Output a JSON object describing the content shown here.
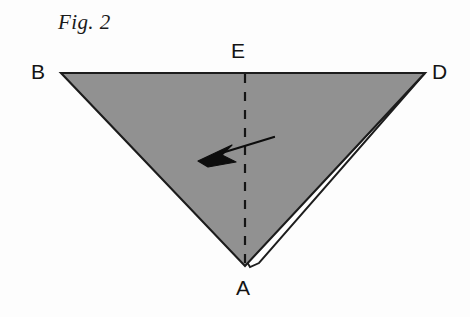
{
  "figure": {
    "caption": "Fig. 2",
    "background_color": "#fdfdfd",
    "fill_color": "#919191",
    "outline_color": "#1c1c1c",
    "flap_color": "#ffffff",
    "arrow_color": "#0d0d0d"
  },
  "labels": {
    "b": "B",
    "e": "E",
    "d": "D",
    "a": "A"
  },
  "geometry": {
    "triangle": {
      "b": [
        61,
        73
      ],
      "d": [
        425,
        73
      ],
      "a": [
        245,
        266
      ],
      "description": "downward-pointing shaded triangle"
    },
    "fold_line": {
      "from": [
        245,
        73
      ],
      "to": [
        245,
        266
      ],
      "style": "dashed",
      "description": "vertical dashed crease from E to A"
    },
    "flap": {
      "description": "thin white folded flap along edge A-D, tapering to zero at D",
      "tip_near_a": [
        258,
        262
      ],
      "converge_at_d": [
        425,
        73
      ]
    },
    "arrow": {
      "tail": [
        274,
        137
      ],
      "tip": [
        198,
        161
      ],
      "description": "arrow pointing left-downward across the dashed crease"
    }
  }
}
